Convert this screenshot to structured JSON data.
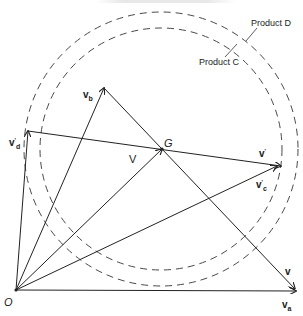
{
  "diagram": {
    "circles": [
      {
        "id": "product-d",
        "label": "Product D",
        "cx": 161,
        "cy": 149,
        "r": 137
      },
      {
        "id": "product-c",
        "label": "Product C",
        "cx": 161,
        "cy": 149,
        "r": 121
      }
    ],
    "points": {
      "origin": {
        "label": "O",
        "x": 16,
        "y": 290
      },
      "G": {
        "label": "G",
        "x": 162,
        "y": 149
      }
    },
    "vectors": [
      {
        "id": "v_a",
        "label_main": "v",
        "label_sub": "a",
        "label_sup": "",
        "from": [
          16,
          290
        ],
        "to": [
          296,
          291
        ]
      },
      {
        "id": "v_b",
        "label_main": "v",
        "label_sub": "b",
        "label_sup": "",
        "from": [
          16,
          290
        ],
        "to": [
          104,
          88
        ]
      },
      {
        "id": "v_d_prime",
        "label_main": "v",
        "label_sub": "d",
        "label_sup": "'",
        "from": [
          16,
          290
        ],
        "to": [
          28,
          131
        ]
      },
      {
        "id": "V",
        "label_main": "V",
        "label_sub": "",
        "label_sup": "",
        "from": [
          16,
          290
        ],
        "to": [
          162,
          149
        ]
      },
      {
        "id": "v_c_prime",
        "label_main": "v",
        "label_sub": "c",
        "label_sup": "'",
        "from": [
          16,
          290
        ],
        "to": [
          277,
          166
        ]
      },
      {
        "id": "v_prime",
        "label_main": "v",
        "label_sub": "",
        "label_sup": "'",
        "from": [
          28,
          131
        ],
        "to": [
          281,
          166
        ]
      },
      {
        "id": "v",
        "label_main": "v",
        "label_sub": "",
        "label_sup": "",
        "from": [
          104,
          88
        ],
        "to": [
          295,
          289
        ]
      }
    ],
    "labels": {
      "product_d": "Product D",
      "product_c": "Product C",
      "origin": "O",
      "G": "G",
      "V": "V",
      "v_main": "v",
      "sub_a": "a",
      "sub_b": "b",
      "sub_c": "c",
      "sub_d": "d",
      "prime": "'"
    }
  }
}
